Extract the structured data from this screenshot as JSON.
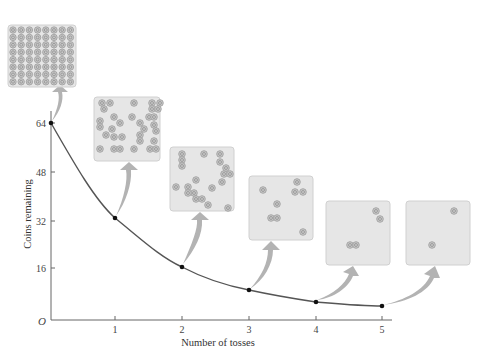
{
  "chart_data": {
    "type": "line",
    "title": "",
    "xlabel": "Number of tosses",
    "ylabel": "Coins remaining",
    "x": [
      0,
      1,
      2,
      3,
      4,
      5
    ],
    "values": [
      64,
      32,
      16,
      8,
      4,
      2
    ],
    "series": [
      {
        "name": "Coins remaining",
        "x": [
          0,
          1,
          2,
          3,
          4,
          5
        ],
        "values": [
          64,
          32,
          16,
          8,
          4,
          2
        ]
      }
    ],
    "x_ticks": [
      "1",
      "2",
      "3",
      "4",
      "5"
    ],
    "y_ticks": [
      "16",
      "32",
      "48",
      "64"
    ],
    "origin_label": "O",
    "xlim": [
      0,
      5.2
    ],
    "ylim": [
      0,
      70
    ],
    "grid": false,
    "legend": null,
    "annotations": [
      {
        "type": "coin-panel",
        "after_tosses": 0,
        "coins": 64
      },
      {
        "type": "coin-panel",
        "after_tosses": 1,
        "coins": 32
      },
      {
        "type": "coin-panel",
        "after_tosses": 2,
        "coins": 16
      },
      {
        "type": "coin-panel",
        "after_tosses": 3,
        "coins": 8
      },
      {
        "type": "coin-panel",
        "after_tosses": 4,
        "coins": 4
      },
      {
        "type": "coin-panel",
        "after_tosses": 5,
        "coins": 2
      }
    ]
  },
  "colors": {
    "curve": "#555555",
    "axis": "#666666",
    "point": "#111111",
    "panel_fill": "#e6e6e6",
    "panel_stroke": "#d0d0d0",
    "arrow": "#b0b0b0",
    "coin": "#9a9a9a"
  },
  "panels": [
    {
      "x": 8,
      "y": 25,
      "w": 68,
      "h": 62,
      "coins": 64
    },
    {
      "x": 94,
      "y": 97,
      "w": 66,
      "h": 64,
      "coins": 32
    },
    {
      "x": 170,
      "y": 147,
      "w": 64,
      "h": 64,
      "coins": 16
    },
    {
      "x": 249,
      "y": 176,
      "w": 64,
      "h": 64,
      "coins": 8
    },
    {
      "x": 326,
      "y": 201,
      "w": 64,
      "h": 64,
      "coins": 4
    },
    {
      "x": 406,
      "y": 201,
      "w": 64,
      "h": 64,
      "coins": 2
    }
  ],
  "coins_positions": {
    "p1": [
      [
        8,
        6
      ],
      [
        16,
        6
      ],
      [
        10,
        12
      ],
      [
        40,
        6
      ],
      [
        58,
        6
      ],
      [
        66,
        6
      ],
      [
        58,
        12
      ],
      [
        64,
        12
      ],
      [
        20,
        20
      ],
      [
        38,
        20
      ],
      [
        55,
        20
      ],
      [
        60,
        20
      ],
      [
        6,
        24
      ],
      [
        6,
        30
      ],
      [
        26,
        26
      ],
      [
        46,
        26
      ],
      [
        60,
        28
      ],
      [
        18,
        32
      ],
      [
        50,
        32
      ],
      [
        62,
        34
      ],
      [
        12,
        38
      ],
      [
        20,
        40
      ],
      [
        28,
        40
      ],
      [
        46,
        38
      ],
      [
        46,
        44
      ],
      [
        60,
        44
      ],
      [
        6,
        52
      ],
      [
        20,
        52
      ],
      [
        26,
        52
      ],
      [
        40,
        52
      ],
      [
        56,
        52
      ],
      [
        62,
        52
      ]
    ],
    "p2": [
      [
        12,
        7
      ],
      [
        12,
        13
      ],
      [
        12,
        19
      ],
      [
        34,
        7
      ],
      [
        50,
        7
      ],
      [
        54,
        27
      ],
      [
        60,
        27
      ],
      [
        52,
        35
      ],
      [
        26,
        33
      ],
      [
        6,
        40
      ],
      [
        18,
        40
      ],
      [
        24,
        46
      ],
      [
        26,
        52
      ],
      [
        32,
        52
      ],
      [
        42,
        41
      ],
      [
        38,
        58
      ],
      [
        58,
        61
      ],
      [
        18,
        46
      ],
      [
        50,
        15
      ],
      [
        56,
        21
      ]
    ],
    "p3": [
      [
        14,
        14
      ],
      [
        48,
        6
      ],
      [
        46,
        16
      ],
      [
        54,
        16
      ],
      [
        28,
        28
      ],
      [
        22,
        42
      ],
      [
        28,
        42
      ],
      [
        54,
        56
      ]
    ],
    "p4": [
      [
        50,
        10
      ],
      [
        54,
        18
      ],
      [
        24,
        44
      ],
      [
        30,
        44
      ]
    ],
    "p5": [
      [
        48,
        10
      ],
      [
        26,
        44
      ]
    ]
  }
}
